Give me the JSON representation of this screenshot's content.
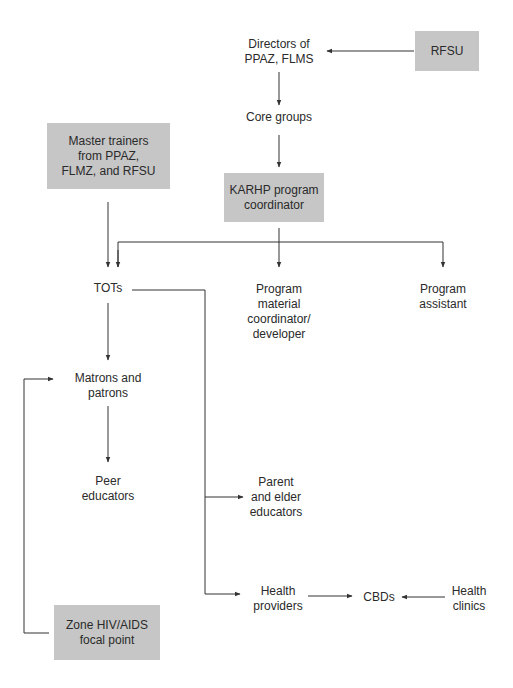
{
  "diagram": {
    "type": "organizational flow chart",
    "box_color": "#c6c6c6",
    "line_color": "#333333",
    "nodes": {
      "rfsu": {
        "label": "RFSU",
        "shaded": true
      },
      "directors": {
        "label": "Directors of\nPPAZ, FLMS",
        "shaded": false
      },
      "core_groups": {
        "label": "Core groups",
        "shaded": false
      },
      "master_trainers": {
        "label": "Master trainers\nfrom PPAZ,\nFLMZ, and RFSU",
        "shaded": true
      },
      "karhp_coordinator": {
        "label": "KARHP program\ncoordinator",
        "shaded": true
      },
      "tots": {
        "label": "TOTs",
        "shaded": false
      },
      "program_material": {
        "label": "Program\nmaterial\ncoordinator/\ndeveloper",
        "shaded": false
      },
      "program_assistant": {
        "label": "Program\nassistant",
        "shaded": false
      },
      "matrons_patrons": {
        "label": "Matrons and\npatrons",
        "shaded": false
      },
      "peer_educators": {
        "label": "Peer\neducators",
        "shaded": false
      },
      "parent_elder": {
        "label": "Parent\nand elder\neducators",
        "shaded": false
      },
      "health_providers": {
        "label": "Health\nproviders",
        "shaded": false
      },
      "cbds": {
        "label": "CBDs",
        "shaded": false
      },
      "health_clinics": {
        "label": "Health\nclinics",
        "shaded": false
      },
      "zone_focal_point": {
        "label": "Zone HIV/AIDS\nfocal point",
        "shaded": true
      }
    },
    "edges": [
      {
        "from": "RFSU",
        "to": "Directors of PPAZ, FLMS"
      },
      {
        "from": "Directors of PPAZ, FLMS",
        "to": "Core groups"
      },
      {
        "from": "Core groups",
        "to": "KARHP program coordinator"
      },
      {
        "from": "Master trainers from PPAZ, FLMZ, and RFSU",
        "to": "TOTs"
      },
      {
        "from": "KARHP program coordinator",
        "to": "TOTs"
      },
      {
        "from": "KARHP program coordinator",
        "to": "Program material coordinator/developer"
      },
      {
        "from": "KARHP program coordinator",
        "to": "Program assistant"
      },
      {
        "from": "TOTs",
        "to": "Matrons and patrons"
      },
      {
        "from": "Matrons and patrons",
        "to": "Peer educators"
      },
      {
        "from": "TOTs",
        "to": "Parent and elder educators"
      },
      {
        "from": "TOTs",
        "to": "Health providers"
      },
      {
        "from": "Health providers",
        "to": "CBDs"
      },
      {
        "from": "Health clinics",
        "to": "CBDs"
      },
      {
        "from": "Zone HIV/AIDS focal point",
        "to": "Matrons and patrons"
      }
    ]
  }
}
